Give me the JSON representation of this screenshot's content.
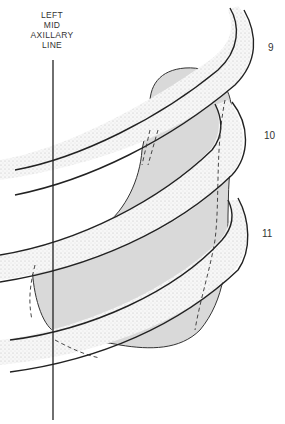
{
  "diagram": {
    "axis_line_label": [
      "LEFT",
      "MID",
      "AXILLARY",
      "LINE"
    ],
    "rib_labels": [
      {
        "id": "rib-9",
        "text": "9"
      },
      {
        "id": "rib-10",
        "text": "10"
      },
      {
        "id": "rib-11",
        "text": "11"
      }
    ],
    "colors": {
      "organ_fill": "#d6d6d6",
      "rib_fill": "#f4f4f4",
      "stroke": "#222222",
      "rib_shading": "#9a9a9a"
    }
  }
}
